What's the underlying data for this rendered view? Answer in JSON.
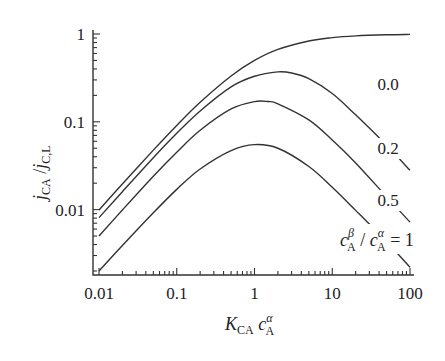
{
  "chart_data": {
    "type": "line",
    "title": "",
    "xlabel": "K_CA c_A^α",
    "ylabel": "j_CA / j_C,L",
    "xscale": "log",
    "yscale": "log",
    "xlim": [
      0.01,
      100
    ],
    "ylim": [
      0.0018,
      1.0
    ],
    "grid": false,
    "x_ticks": [
      {
        "value": 0.01,
        "label": "0.01"
      },
      {
        "value": 0.1,
        "label": "0.1"
      },
      {
        "value": 1,
        "label": "1"
      },
      {
        "value": 10,
        "label": "10"
      },
      {
        "value": 100,
        "label": "100"
      }
    ],
    "y_ticks": [
      {
        "value": 0.01,
        "label": "0.01"
      },
      {
        "value": 0.1,
        "label": "0.1"
      },
      {
        "value": 1,
        "label": "1"
      }
    ],
    "legend_title": "c_A^β / c_A^α",
    "series": [
      {
        "name": "0.0",
        "label": "0.0",
        "x": [
          0.01,
          0.02,
          0.05,
          0.1,
          0.2,
          0.5,
          1,
          2,
          5,
          10,
          20,
          50,
          100
        ],
        "values": [
          0.0099,
          0.0196,
          0.0476,
          0.0909,
          0.167,
          0.333,
          0.5,
          0.667,
          0.833,
          0.909,
          0.952,
          0.98,
          0.99
        ]
      },
      {
        "name": "0.2",
        "label": "0.2",
        "x": [
          0.01,
          0.02,
          0.05,
          0.1,
          0.2,
          0.5,
          1,
          2,
          3,
          5,
          10,
          20,
          50,
          100
        ],
        "values": [
          0.0081,
          0.016,
          0.039,
          0.074,
          0.133,
          0.25,
          0.33,
          0.37,
          0.36,
          0.31,
          0.21,
          0.12,
          0.054,
          0.028
        ]
      },
      {
        "name": "0.5",
        "label": "0.5",
        "x": [
          0.01,
          0.02,
          0.05,
          0.1,
          0.2,
          0.5,
          1,
          1.5,
          2,
          5,
          10,
          20,
          50,
          100
        ],
        "values": [
          0.005,
          0.0099,
          0.024,
          0.045,
          0.08,
          0.14,
          0.17,
          0.17,
          0.16,
          0.105,
          0.062,
          0.034,
          0.014,
          0.0072
        ]
      },
      {
        "name": "1",
        "label": "c_A^β / c_A^α = 1",
        "x": [
          0.01,
          0.02,
          0.05,
          0.1,
          0.2,
          0.5,
          1,
          2,
          5,
          10,
          20,
          50,
          100
        ],
        "values": [
          0.002,
          0.0039,
          0.0092,
          0.017,
          0.029,
          0.047,
          0.055,
          0.05,
          0.031,
          0.018,
          0.0098,
          0.0043,
          0.0022
        ]
      }
    ]
  },
  "labels": {
    "y_axis": {
      "main": "j",
      "sub1": "CA",
      "slash": " /",
      "main2": "j",
      "sub2": "C,L"
    },
    "x_axis": {
      "main": "K",
      "sub": "CA",
      "c": " c",
      "sup": "α",
      "csub": "A"
    },
    "legend": {
      "c1": "c",
      "sup1": "β",
      "sub1": "A",
      "slash": " / ",
      "c2": "c",
      "sup2": "α",
      "sub2": "A",
      "eq": " = 1"
    }
  }
}
